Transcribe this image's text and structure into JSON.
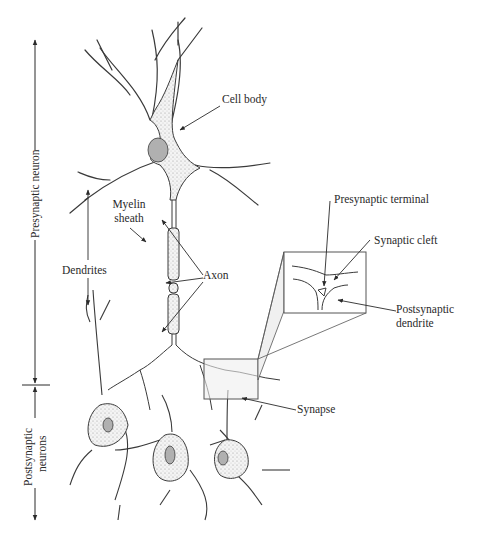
{
  "diagram": {
    "colors": {
      "line": "#3a3a3a",
      "stipple": "#8a8a8a",
      "inset_fill": "#efefef",
      "background": "#ffffff"
    },
    "labels": {
      "cell_body": "Cell body",
      "myelin_sheath_line1": "Myelin",
      "myelin_sheath_line2": "sheath",
      "axon": "Axon",
      "dendrites": "Dendrites",
      "presynaptic_terminal": "Presynaptic terminal",
      "synaptic_cleft": "Synaptic cleft",
      "postsynaptic_dendrite_line1": "Postsynaptic",
      "postsynaptic_dendrite_line2": "dendrite",
      "synapse": "Synapse"
    },
    "side_brackets": {
      "presynaptic": "Presynaptic neuron",
      "postsynaptic_line1": "Postsynaptic",
      "postsynaptic_line2": "neurons"
    }
  }
}
